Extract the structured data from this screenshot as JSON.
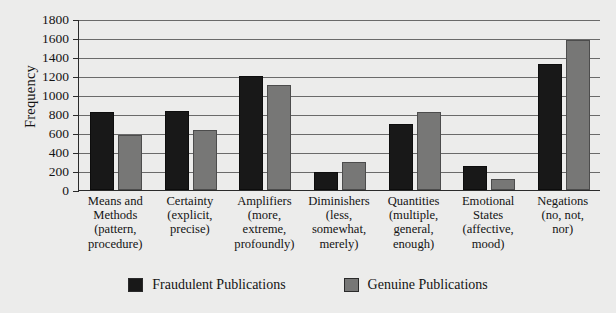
{
  "chart_data": {
    "type": "bar",
    "title": "",
    "xlabel": "",
    "ylabel": "Frequency",
    "ylim": [
      0,
      1800
    ],
    "yticks": [
      0,
      200,
      400,
      600,
      800,
      1000,
      1200,
      1400,
      1600,
      1800
    ],
    "grid": true,
    "legend_position": "bottom",
    "categories": [
      "Means and Methods (pattern, procedure)",
      "Certainty (explicit, precise)",
      "Amplifiers (more, extreme, profoundly)",
      "Diminishers (less, somewhat, merely)",
      "Quantities (multiple, general, enough)",
      "Emotional States (affective, mood)",
      "Negations (no, not, nor)"
    ],
    "category_lines": [
      [
        "Means and",
        "Methods",
        "(pattern,",
        "procedure)"
      ],
      [
        "Certainty",
        "(explicit,",
        "precise)"
      ],
      [
        "Amplifiers",
        "(more,",
        "extreme,",
        "profoundly)"
      ],
      [
        "Diminishers",
        "(less,",
        "somewhat,",
        "merely)"
      ],
      [
        "Quantities",
        "(multiple,",
        "general,",
        "enough)"
      ],
      [
        "Emotional",
        "States",
        "(affective,",
        "mood)"
      ],
      [
        "Negations",
        "(no, not,",
        "nor)"
      ]
    ],
    "series": [
      {
        "name": "Fraudulent Publications",
        "color": "#181818",
        "values": [
          820,
          830,
          1195,
          190,
          700,
          250,
          1330
        ]
      },
      {
        "name": "Genuine Publications",
        "color": "#777776",
        "values": [
          580,
          635,
          1110,
          300,
          820,
          120,
          1580
        ]
      }
    ]
  },
  "legend": {
    "items": [
      {
        "label": "Fraudulent Publications",
        "swatch": "dark"
      },
      {
        "label": "Genuine Publications",
        "swatch": "light"
      }
    ]
  },
  "colors": {
    "background": "#ececeb",
    "axis": "#2b2b2b",
    "grid": "#6a6a6a",
    "fraudulent": "#181818",
    "genuine": "#777776"
  }
}
